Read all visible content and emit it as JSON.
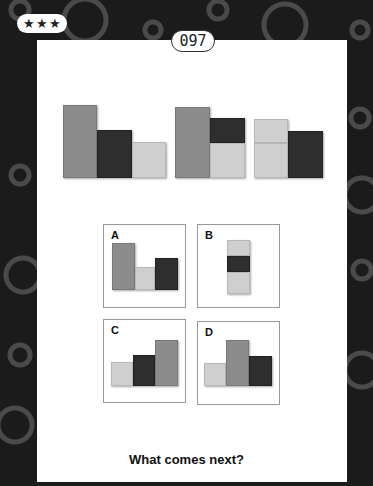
{
  "header": {
    "difficulty_stars": "★★★",
    "puzzle_number": "097"
  },
  "colors": {
    "medium_gray": "#8c8c8c",
    "dark": "#2e2e2e",
    "light_gray": "#cfcfcf",
    "background": "#1b1b1b",
    "card": "#ffffff"
  },
  "sequence": [
    {
      "blocks": [
        {
          "color": "medium",
          "x": 63,
          "y": 105,
          "w": 34,
          "h": 73
        },
        {
          "color": "dark",
          "x": 97,
          "y": 130,
          "w": 35,
          "h": 48
        },
        {
          "color": "light",
          "x": 132,
          "y": 142,
          "w": 34,
          "h": 36
        }
      ]
    },
    {
      "blocks": [
        {
          "color": "medium",
          "x": 175,
          "y": 107,
          "w": 35,
          "h": 71
        },
        {
          "color": "dark",
          "x": 210,
          "y": 118,
          "w": 35,
          "h": 25
        },
        {
          "color": "light",
          "x": 210,
          "y": 143,
          "w": 35,
          "h": 35
        }
      ]
    },
    {
      "blocks": [
        {
          "color": "light",
          "x": 254,
          "y": 119,
          "w": 34,
          "h": 24
        },
        {
          "color": "light",
          "x": 254,
          "y": 143,
          "w": 34,
          "h": 35
        },
        {
          "color": "dark",
          "x": 288,
          "y": 131,
          "w": 35,
          "h": 47
        }
      ]
    }
  ],
  "options": [
    {
      "label": "A"
    },
    {
      "label": "B"
    },
    {
      "label": "C"
    },
    {
      "label": "D"
    }
  ],
  "question": "What comes next?"
}
